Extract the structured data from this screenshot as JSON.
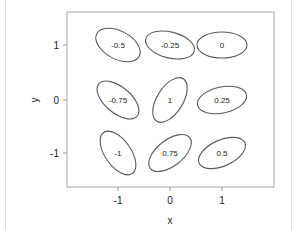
{
  "chart_data": {
    "type": "ellipse-grid",
    "title": "",
    "xlabel": "x",
    "ylabel": "y",
    "xticks": [
      -1,
      0,
      1
    ],
    "yticks": [
      -1,
      0,
      1
    ],
    "xlim": [
      -1.95,
      2.0
    ],
    "ylim": [
      -1.65,
      1.6
    ],
    "grid": false,
    "legend": null,
    "points": [
      {
        "x": -1,
        "y": 1,
        "label": "-0.5",
        "value": -0.5
      },
      {
        "x": 0,
        "y": 1,
        "label": "-0.25",
        "value": -0.25
      },
      {
        "x": 1,
        "y": 1,
        "label": "0",
        "value": 0
      },
      {
        "x": -1,
        "y": 0,
        "label": "-0.75",
        "value": -0.75
      },
      {
        "x": 0,
        "y": 0,
        "label": "1",
        "value": 1
      },
      {
        "x": 1,
        "y": 0,
        "label": "0.25",
        "value": 0.25
      },
      {
        "x": -1,
        "y": -1,
        "label": "-1",
        "value": -1
      },
      {
        "x": 0,
        "y": -1,
        "label": "0.75",
        "value": 0.75
      },
      {
        "x": 1,
        "y": -1,
        "label": "0.5",
        "value": 0.5
      }
    ]
  },
  "axis": {
    "x_label": "x",
    "y_label": "y",
    "x_ticks": [
      "-1",
      "0",
      "1"
    ],
    "y_ticks": [
      "1",
      "0",
      "-1"
    ]
  },
  "ellipses": [
    {
      "label": "-0.5",
      "cx": 118,
      "cy": 45,
      "rx": 24,
      "ry": 14,
      "angle": 28
    },
    {
      "label": "-0.25",
      "cx": 170,
      "cy": 45,
      "rx": 25,
      "ry": 13,
      "angle": 14
    },
    {
      "label": "0",
      "cx": 222,
      "cy": 45,
      "rx": 25,
      "ry": 13,
      "angle": 0
    },
    {
      "label": "-0.75",
      "cx": 118,
      "cy": 100,
      "rx": 25,
      "ry": 13,
      "angle": 40
    },
    {
      "label": "1",
      "cx": 170,
      "cy": 100,
      "rx": 25,
      "ry": 13,
      "angle": -58
    },
    {
      "label": "0.25",
      "cx": 222,
      "cy": 100,
      "rx": 25,
      "ry": 13,
      "angle": -12
    },
    {
      "label": "-1",
      "cx": 118,
      "cy": 153,
      "rx": 25,
      "ry": 13,
      "angle": 55
    },
    {
      "label": "0.75",
      "cx": 170,
      "cy": 153,
      "rx": 25,
      "ry": 13,
      "angle": -38
    },
    {
      "label": "0.5",
      "cx": 222,
      "cy": 153,
      "rx": 25,
      "ry": 13,
      "angle": -24
    }
  ],
  "colors": {
    "ellipse_stroke": "#5a5a5a",
    "axis": "#9a9a9a",
    "frame": "#dcdcdc",
    "text": "#222222"
  }
}
